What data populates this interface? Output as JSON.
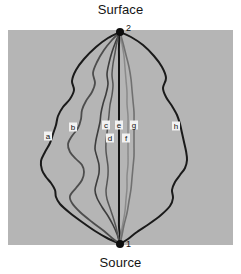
{
  "figure": {
    "background_color": "#ffffff",
    "panel_color": "#b5b5b5",
    "panel": {
      "x": 8,
      "y": 30,
      "width": 225,
      "height": 215
    }
  },
  "annotations": {
    "surface_caption": "Surface",
    "source_caption": "Source",
    "surface_node_number": "2",
    "source_node_number": "1"
  },
  "nodes": [
    {
      "id": "source",
      "number": "1",
      "x": 120,
      "y": 244,
      "label": "Source"
    },
    {
      "id": "surface",
      "number": "2",
      "x": 120,
      "y": 32,
      "label": "Surface"
    }
  ],
  "chart_data": {
    "type": "line",
    "title": "",
    "xlabel": "",
    "ylabel": "",
    "legend_position": "inline-labels",
    "grid": false,
    "endpoints": {
      "source": [
        120,
        244
      ],
      "surface": [
        120,
        32
      ]
    },
    "series": [
      {
        "name": "a",
        "label": "a",
        "color": "#1a1a1a",
        "width": 2.0,
        "label_x": 48,
        "label_y": 136,
        "points": [
          [
            120,
            32
          ],
          [
            108,
            38
          ],
          [
            96,
            47
          ],
          [
            84,
            59
          ],
          [
            76,
            70
          ],
          [
            72,
            81
          ],
          [
            74,
            90
          ],
          [
            70,
            99
          ],
          [
            63,
            107
          ],
          [
            58,
            116
          ],
          [
            56,
            125
          ],
          [
            53,
            134
          ],
          [
            50,
            143
          ],
          [
            45,
            152
          ],
          [
            41,
            161
          ],
          [
            42,
            170
          ],
          [
            46,
            177
          ],
          [
            51,
            183
          ],
          [
            55,
            190
          ],
          [
            56,
            197
          ],
          [
            60,
            204
          ],
          [
            70,
            213
          ],
          [
            82,
            222
          ],
          [
            95,
            231
          ],
          [
            107,
            238
          ],
          [
            120,
            244
          ]
        ]
      },
      {
        "name": "b",
        "label": "b",
        "color": "#4d4d4d",
        "width": 1.8,
        "label_x": 73,
        "label_y": 127,
        "points": [
          [
            120,
            32
          ],
          [
            112,
            40
          ],
          [
            104,
            50
          ],
          [
            97,
            62
          ],
          [
            93,
            73
          ],
          [
            95,
            83
          ],
          [
            92,
            92
          ],
          [
            86,
            101
          ],
          [
            82,
            110
          ],
          [
            81,
            119
          ],
          [
            78,
            128
          ],
          [
            72,
            136
          ],
          [
            68,
            144
          ],
          [
            70,
            152
          ],
          [
            76,
            159
          ],
          [
            82,
            165
          ],
          [
            84,
            172
          ],
          [
            82,
            180
          ],
          [
            76,
            188
          ],
          [
            70,
            196
          ],
          [
            72,
            203
          ],
          [
            80,
            212
          ],
          [
            92,
            222
          ],
          [
            104,
            231
          ],
          [
            112,
            238
          ],
          [
            120,
            244
          ]
        ]
      },
      {
        "name": "c",
        "label": "c",
        "color": "#3d3d3d",
        "width": 1.6,
        "label_x": 106,
        "label_y": 125,
        "points": [
          [
            120,
            32
          ],
          [
            116,
            41
          ],
          [
            112,
            52
          ],
          [
            109,
            63
          ],
          [
            107,
            74
          ],
          [
            108,
            84
          ],
          [
            106,
            94
          ],
          [
            103,
            104
          ],
          [
            101,
            113
          ],
          [
            100,
            122
          ],
          [
            98,
            131
          ],
          [
            96,
            140
          ],
          [
            95,
            149
          ],
          [
            97,
            157
          ],
          [
            99,
            165
          ],
          [
            99,
            173
          ],
          [
            97,
            181
          ],
          [
            95,
            190
          ],
          [
            97,
            198
          ],
          [
            102,
            207
          ],
          [
            108,
            216
          ],
          [
            113,
            225
          ],
          [
            117,
            234
          ],
          [
            120,
            244
          ]
        ]
      },
      {
        "name": "d",
        "label": "d",
        "color": "#555555",
        "width": 1.5,
        "label_x": 110,
        "label_y": 138,
        "points": [
          [
            120,
            32
          ],
          [
            117,
            42
          ],
          [
            115,
            53
          ],
          [
            113,
            64
          ],
          [
            112,
            75
          ],
          [
            113,
            85
          ],
          [
            112,
            95
          ],
          [
            110,
            105
          ],
          [
            109,
            115
          ],
          [
            108,
            124
          ],
          [
            107,
            133
          ],
          [
            106,
            142
          ],
          [
            106,
            151
          ],
          [
            107,
            159
          ],
          [
            108,
            167
          ],
          [
            108,
            175
          ],
          [
            107,
            183
          ],
          [
            106,
            191
          ],
          [
            107,
            199
          ],
          [
            110,
            208
          ],
          [
            113,
            217
          ],
          [
            116,
            227
          ],
          [
            118,
            236
          ],
          [
            120,
            244
          ]
        ]
      },
      {
        "name": "e",
        "label": "e",
        "color": "#151515",
        "width": 2.0,
        "label_x": 119,
        "label_y": 125,
        "points": [
          [
            120,
            32
          ],
          [
            119,
            45
          ],
          [
            119,
            58
          ],
          [
            119,
            71
          ],
          [
            119,
            84
          ],
          [
            119,
            97
          ],
          [
            119,
            110
          ],
          [
            119,
            123
          ],
          [
            119,
            136
          ],
          [
            119,
            149
          ],
          [
            119,
            162
          ],
          [
            119,
            175
          ],
          [
            119,
            188
          ],
          [
            119,
            201
          ],
          [
            119,
            214
          ],
          [
            119,
            227
          ],
          [
            120,
            236
          ],
          [
            120,
            244
          ]
        ]
      },
      {
        "name": "f",
        "label": "f",
        "color": "#8a8a8a",
        "width": 1.5,
        "label_x": 126,
        "label_y": 138,
        "points": [
          [
            120,
            32
          ],
          [
            122,
            44
          ],
          [
            124,
            56
          ],
          [
            125,
            68
          ],
          [
            126,
            80
          ],
          [
            127,
            92
          ],
          [
            127,
            104
          ],
          [
            128,
            116
          ],
          [
            128,
            128
          ],
          [
            128,
            140
          ],
          [
            128,
            152
          ],
          [
            128,
            164
          ],
          [
            127,
            176
          ],
          [
            127,
            188
          ],
          [
            126,
            199
          ],
          [
            125,
            211
          ],
          [
            123,
            223
          ],
          [
            121,
            234
          ],
          [
            120,
            244
          ]
        ]
      },
      {
        "name": "g",
        "label": "g",
        "color": "#707070",
        "width": 1.6,
        "label_x": 134,
        "label_y": 125,
        "points": [
          [
            120,
            32
          ],
          [
            123,
            43
          ],
          [
            126,
            55
          ],
          [
            129,
            67
          ],
          [
            131,
            79
          ],
          [
            132,
            90
          ],
          [
            133,
            101
          ],
          [
            134,
            112
          ],
          [
            134,
            123
          ],
          [
            134,
            134
          ],
          [
            134,
            145
          ],
          [
            134,
            156
          ],
          [
            133,
            167
          ],
          [
            132,
            178
          ],
          [
            131,
            189
          ],
          [
            129,
            201
          ],
          [
            127,
            213
          ],
          [
            124,
            225
          ],
          [
            122,
            235
          ],
          [
            120,
            244
          ]
        ]
      },
      {
        "name": "h",
        "label": "h",
        "color": "#1a1a1a",
        "width": 2.0,
        "label_x": 176,
        "label_y": 126,
        "points": [
          [
            120,
            32
          ],
          [
            131,
            37
          ],
          [
            143,
            45
          ],
          [
            154,
            56
          ],
          [
            162,
            67
          ],
          [
            166,
            78
          ],
          [
            163,
            88
          ],
          [
            166,
            97
          ],
          [
            172,
            106
          ],
          [
            177,
            115
          ],
          [
            180,
            124
          ],
          [
            182,
            133
          ],
          [
            184,
            142
          ],
          [
            186,
            151
          ],
          [
            187,
            160
          ],
          [
            185,
            168
          ],
          [
            180,
            175
          ],
          [
            175,
            182
          ],
          [
            172,
            190
          ],
          [
            173,
            198
          ],
          [
            170,
            206
          ],
          [
            161,
            215
          ],
          [
            149,
            224
          ],
          [
            137,
            232
          ],
          [
            128,
            239
          ],
          [
            120,
            244
          ]
        ]
      }
    ]
  }
}
